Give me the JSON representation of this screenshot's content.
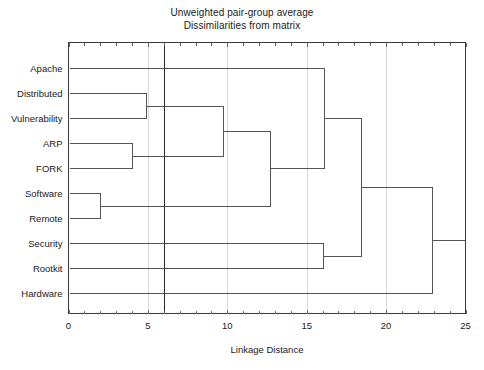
{
  "title": {
    "line1": "Unweighted pair-group average",
    "line2": "Dissimilarities from matrix"
  },
  "chart_data": {
    "type": "dendrogram",
    "title": "Unweighted pair-group average\nDissimilarities from matrix",
    "xlabel": "Linkage Distance",
    "ylabel": "",
    "xlim": [
      0,
      25
    ],
    "xticks": [
      0,
      5,
      10,
      15,
      20,
      25
    ],
    "xtick_labels": [
      "0",
      "5",
      "10",
      "15",
      "20",
      "25"
    ],
    "minor_tick_step": 1,
    "grid": "vertical-major-only",
    "legend": "none",
    "orientation": "horizontal-left-to-right",
    "leaves": [
      "Apache",
      "Distributed",
      "Vulnerability",
      "ARP",
      "FORK",
      "Software",
      "Remote",
      "Security",
      "Rootkit",
      "Hardware"
    ],
    "merges": [
      {
        "id": "m1",
        "label": "Software + Remote",
        "children": [
          "Software",
          "Remote"
        ],
        "distance": 2.0
      },
      {
        "id": "m2",
        "label": "ARP + FORK",
        "children": [
          "ARP",
          "FORK"
        ],
        "distance": 4.0
      },
      {
        "id": "m3",
        "label": "Distributed + Vulnerability",
        "children": [
          "Distributed",
          "Vulnerability"
        ],
        "distance": 4.9
      },
      {
        "id": "m4",
        "label": "(Distributed,Vulnerability) + (ARP,FORK)",
        "children": [
          "m3",
          "m2"
        ],
        "distance": 9.7
      },
      {
        "id": "m5",
        "label": "m4 + (Software,Remote)",
        "children": [
          "m4",
          "m1"
        ],
        "distance": 12.7
      },
      {
        "id": "m6",
        "label": "Apache + m5",
        "children": [
          "Apache",
          "m5"
        ],
        "distance": 16.1
      },
      {
        "id": "m7",
        "label": "Security + Rootkit",
        "children": [
          "Security",
          "Rootkit"
        ],
        "distance": 16.0
      },
      {
        "id": "m8",
        "label": "m6 + m7",
        "children": [
          "m6",
          "m7"
        ],
        "distance": 18.4
      },
      {
        "id": "m9",
        "label": "m8 + Hardware",
        "children": [
          "m8",
          "Hardware"
        ],
        "distance": 22.9
      }
    ],
    "cut_line": {
      "distance": 6.0,
      "label": ""
    },
    "colors": {
      "background": "#ffffff",
      "frame": "#3a3a3a",
      "branch": "#555555",
      "grid": "#d8d8dc",
      "cut_line": "#2a2a2a",
      "text": "#1a1a1a"
    }
  }
}
